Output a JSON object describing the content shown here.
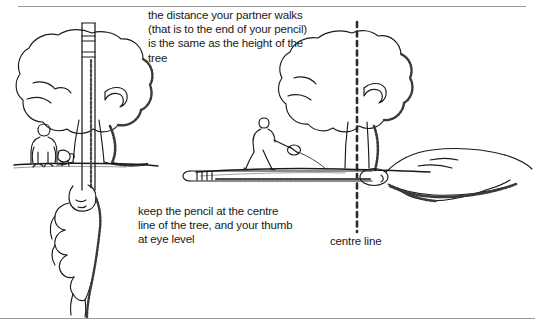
{
  "figure": {
    "background_color": "#ffffff",
    "ink_color": "#1a1a1a",
    "rule_color": "#9b9b9b",
    "width": 535,
    "height": 328
  },
  "captions": {
    "top": "the distance your partner walks\n(that is to the end of your pencil)\nis the same as the height of the\ntree",
    "left": "keep the pencil at the centre\nline of the tree, and your thumb\nat eye level",
    "centre_line": "centre line"
  },
  "scenes": {
    "left": {
      "name": "sighting-the-tree-height",
      "elements": [
        "tree-canopy",
        "tree-trunk",
        "standing-person",
        "dog",
        "ground-line",
        "vertical-pencil",
        "hand-gripping-pencil",
        "thumb-at-eye-level"
      ]
    },
    "right": {
      "name": "partner-walks-the-distance",
      "elements": [
        "tree-canopy",
        "tree-trunk",
        "dashed-centre-line",
        "walking-partner",
        "partner-marker",
        "ground-line",
        "horizontal-pencil",
        "hand-holding-pencil-sideways",
        "thumb-tip"
      ]
    }
  }
}
